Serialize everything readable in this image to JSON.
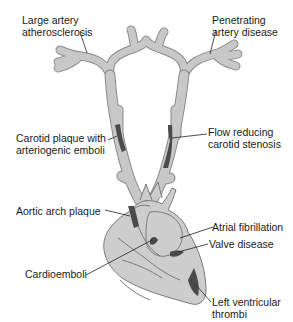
{
  "diagram": {
    "colors": {
      "vessel_fill": "#c8c8c8",
      "vessel_stroke": "#8a8a8a",
      "lesion": "#4a4a4a",
      "heart_fill": "#cdcdcd",
      "leader_line": "#222222",
      "text": "#1a1a1a"
    },
    "labels": [
      {
        "id": "large-artery",
        "line1": "Large artery",
        "line2": "atherosclerosis"
      },
      {
        "id": "penetrating-artery",
        "line1": "Penetrating",
        "line2": "artery disease"
      },
      {
        "id": "carotid-plaque",
        "line1": "Carotid plaque with",
        "line2": "arteriogenic emboli"
      },
      {
        "id": "flow-reducing",
        "line1": "Flow reducing",
        "line2": "carotid stenosis"
      },
      {
        "id": "aortic-arch",
        "line1": "Aortic arch plaque"
      },
      {
        "id": "atrial-fib",
        "line1": "Atrial fibrillation"
      },
      {
        "id": "valve-disease",
        "line1": "Valve disease"
      },
      {
        "id": "cardioemboli",
        "line1": "Cardioemboli"
      },
      {
        "id": "left-ventricular",
        "line1": "Left ventricular",
        "line2": "thrombi"
      }
    ]
  }
}
